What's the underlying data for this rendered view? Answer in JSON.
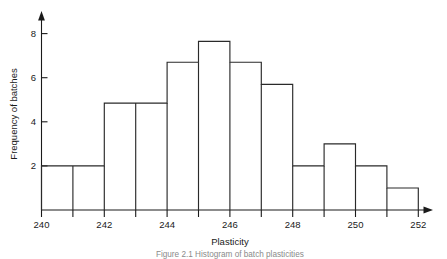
{
  "chart_data": {
    "type": "bar",
    "title": "",
    "subtitle": "",
    "xlabel": "Plasticity",
    "ylabel": "Frequency of batches",
    "categories": [
      "240-241",
      "241-242",
      "242-243",
      "243-244",
      "244-245",
      "245-246",
      "246-247",
      "247-248",
      "248-249",
      "249-250",
      "250-251",
      "251-252"
    ],
    "bin_edges": [
      240,
      241,
      242,
      243,
      244,
      245,
      246,
      247,
      248,
      249,
      250,
      251,
      252
    ],
    "values": [
      2,
      2,
      4.85,
      4.85,
      6.7,
      7.65,
      6.7,
      5.7,
      2,
      3,
      2,
      1
    ],
    "xlim": [
      240,
      252
    ],
    "ylim": [
      0,
      8.8
    ],
    "x_ticks": [
      240,
      241,
      242,
      243,
      244,
      245,
      246,
      247,
      248,
      249,
      250,
      251,
      252
    ],
    "x_tick_labels": [
      "240",
      "",
      "242",
      "",
      "244",
      "",
      "246",
      "",
      "248",
      "",
      "250",
      "",
      "252"
    ],
    "y_ticks": [
      2,
      4,
      6,
      8
    ],
    "y_tick_labels": [
      "2",
      "4",
      "6",
      "8"
    ],
    "grid": false,
    "legend": null,
    "bar_style": "outline",
    "colors": {
      "bar_stroke": "#2a2a2a",
      "bar_fill": "#ffffff",
      "axis": "#1a1a1a",
      "text": "#1a1a1a",
      "caption": "#8a8a8a",
      "background": "#ffffff"
    }
  },
  "caption": {
    "text": "Figure 2.1   Histogram of batch plasticities"
  },
  "axes": {
    "x_title": "Plasticity",
    "y_title": "Frequency of batches"
  },
  "x_tick_labels": {
    "t0": "240",
    "t2": "242",
    "t4": "244",
    "t6": "246",
    "t8": "248",
    "t10": "250",
    "t12": "252"
  },
  "y_tick_labels": {
    "y2": "2",
    "y4": "4",
    "y6": "6",
    "y8": "8"
  }
}
